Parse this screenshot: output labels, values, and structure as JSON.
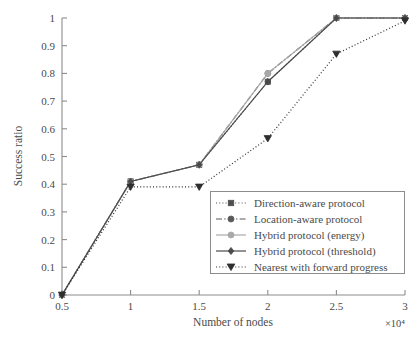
{
  "chart_data": {
    "type": "line",
    "title": "",
    "xlabel": "Number of nodes",
    "ylabel": "Success ratio",
    "x_multiplier": "×10⁴",
    "x": [
      0.5,
      1,
      1.5,
      2,
      2.5,
      3
    ],
    "xticklabels": [
      "0.5",
      "1",
      "1.5",
      "2",
      "2.5",
      "3"
    ],
    "xlim": [
      0.5,
      3
    ],
    "ylim": [
      0,
      1
    ],
    "yticklabels": [
      "0",
      "0.1",
      "0.2",
      "0.3",
      "0.4",
      "0.5",
      "0.6",
      "0.7",
      "0.8",
      "0.9",
      "1"
    ],
    "yticks": [
      0,
      0.1,
      0.2,
      0.3,
      0.4,
      0.5,
      0.6,
      0.7,
      0.8,
      0.9,
      1
    ],
    "grid": false,
    "legend_position": "lower right (inside axes)",
    "series": [
      {
        "name": "Direction-aware protocol",
        "values": [
          0,
          0.41,
          0.47,
          0.77,
          1.0,
          1.0
        ],
        "marker": "square",
        "linestyle": "dotted",
        "color": "#4f4f4f"
      },
      {
        "name": "Location-aware protocol",
        "values": [
          0,
          0.41,
          0.47,
          0.8,
          1.0,
          1.0
        ],
        "marker": "circle",
        "linestyle": "dash-dot",
        "color": "#5a5a5a"
      },
      {
        "name": "Hybrid protocol (energy)",
        "values": [
          0,
          0.41,
          0.47,
          0.8,
          1.0,
          1.0
        ],
        "marker": "circle",
        "linestyle": "solid",
        "color": "#a8a8a8"
      },
      {
        "name": "Hybrid protocol (threshold)",
        "values": [
          0,
          0.41,
          0.47,
          0.77,
          1.0,
          1.0
        ],
        "marker": "diamond",
        "linestyle": "solid",
        "color": "#4a4a4a"
      },
      {
        "name": "Nearest with forward progress",
        "values": [
          0,
          0.39,
          0.39,
          0.565,
          0.87,
          0.99
        ],
        "marker": "triangle-down",
        "linestyle": "dotted",
        "color": "#2e2e2e"
      }
    ]
  },
  "legend": {
    "entries": [
      "Direction-aware protocol",
      "Location-aware protocol",
      "Hybrid protocol (energy)",
      "Hybrid protocol (threshold)",
      "Nearest with forward progress"
    ]
  },
  "axes": {
    "x_title": "Number of nodes",
    "y_title": "Success ratio",
    "x_exponent": "×10⁴"
  }
}
